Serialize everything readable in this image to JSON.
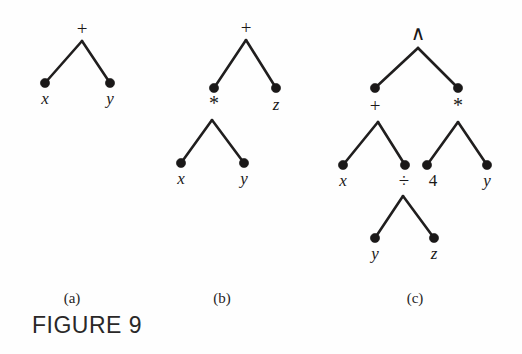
{
  "figure": {
    "caption": "FIGURE 9",
    "background_color": "#fefefe",
    "ink_color": "#1a1818"
  },
  "panels": [
    {
      "id": "a",
      "caption": "(a)",
      "expression": "x + y",
      "nodes": [
        {
          "name": "root",
          "label": "+",
          "kind": "operator",
          "x": 82,
          "y": 41,
          "has_dot": false,
          "label_dx": 0,
          "label_dy": -6
        },
        {
          "name": "leaf-left",
          "label": "x",
          "kind": "variable",
          "x": 45,
          "y": 83,
          "has_dot": true,
          "label_dx": 0,
          "label_dy": 21
        },
        {
          "name": "leaf-right",
          "label": "y",
          "kind": "variable",
          "x": 110,
          "y": 83,
          "has_dot": true,
          "label_dx": 0,
          "label_dy": 21
        }
      ],
      "edges": [
        {
          "from": "root",
          "to": "leaf-left"
        },
        {
          "from": "root",
          "to": "leaf-right"
        }
      ]
    },
    {
      "id": "b",
      "caption": "(b)",
      "expression": "(x * y) + z",
      "nodes": [
        {
          "name": "root",
          "label": "+",
          "kind": "operator",
          "x": 246,
          "y": 40,
          "has_dot": false,
          "label_dx": 0,
          "label_dy": -6
        },
        {
          "name": "mul-node",
          "label": "*",
          "kind": "operator",
          "x": 214,
          "y": 88,
          "has_dot": true,
          "label_dx": 0,
          "label_dy": 22
        },
        {
          "name": "leaf-z",
          "label": "z",
          "kind": "variable",
          "x": 276,
          "y": 88,
          "has_dot": true,
          "label_dx": 0,
          "label_dy": 22
        },
        {
          "name": "mul-apex",
          "label": "",
          "kind": "junction",
          "x": 212,
          "y": 120,
          "has_dot": false,
          "label_dx": 0,
          "label_dy": 0
        },
        {
          "name": "leaf-x",
          "label": "x",
          "kind": "variable",
          "x": 181,
          "y": 163,
          "has_dot": true,
          "label_dx": 0,
          "label_dy": 21
        },
        {
          "name": "leaf-y",
          "label": "y",
          "kind": "variable",
          "x": 244,
          "y": 163,
          "has_dot": true,
          "label_dx": 0,
          "label_dy": 21
        }
      ],
      "edges": [
        {
          "from": "root",
          "to": "mul-node"
        },
        {
          "from": "root",
          "to": "leaf-z"
        },
        {
          "from": "mul-apex",
          "to": "leaf-x"
        },
        {
          "from": "mul-apex",
          "to": "leaf-y"
        }
      ]
    },
    {
      "id": "c",
      "caption": "(c)",
      "expression": "(x + (y / z)) ^ (4 * y)",
      "nodes": [
        {
          "name": "root",
          "label": "∧",
          "kind": "operator",
          "x": 418,
          "y": 48,
          "has_dot": false,
          "label_dx": 0,
          "label_dy": -8
        },
        {
          "name": "plus-node",
          "label": "+",
          "kind": "operator",
          "x": 375,
          "y": 88,
          "has_dot": true,
          "label_dx": 0,
          "label_dy": 24
        },
        {
          "name": "mul-node",
          "label": "*",
          "kind": "operator",
          "x": 458,
          "y": 88,
          "has_dot": true,
          "label_dx": 0,
          "label_dy": 24
        },
        {
          "name": "plus-apex",
          "label": "",
          "kind": "junction",
          "x": 378,
          "y": 122,
          "has_dot": false,
          "label_dx": 0,
          "label_dy": 0
        },
        {
          "name": "leaf-x",
          "label": "x",
          "kind": "variable",
          "x": 343,
          "y": 165,
          "has_dot": true,
          "label_dx": 0,
          "label_dy": 21
        },
        {
          "name": "div-node",
          "label": "÷",
          "kind": "operator",
          "x": 405,
          "y": 165,
          "has_dot": true,
          "label_dx": -1,
          "label_dy": 22
        },
        {
          "name": "mul-apex",
          "label": "",
          "kind": "junction",
          "x": 458,
          "y": 122,
          "has_dot": false,
          "label_dx": 0,
          "label_dy": 0
        },
        {
          "name": "leaf-four",
          "label": "4",
          "kind": "number",
          "x": 427,
          "y": 165,
          "has_dot": true,
          "label_dx": 6,
          "label_dy": 21
        },
        {
          "name": "leaf-y-right",
          "label": "y",
          "kind": "variable",
          "x": 487,
          "y": 165,
          "has_dot": true,
          "label_dx": 0,
          "label_dy": 21
        },
        {
          "name": "div-apex",
          "label": "",
          "kind": "junction",
          "x": 403,
          "y": 196,
          "has_dot": false,
          "label_dx": 0,
          "label_dy": 0
        },
        {
          "name": "leaf-y-bottom",
          "label": "y",
          "kind": "variable",
          "x": 375,
          "y": 238,
          "has_dot": true,
          "label_dx": 0,
          "label_dy": 21
        },
        {
          "name": "leaf-z-bottom",
          "label": "z",
          "kind": "variable",
          "x": 434,
          "y": 238,
          "has_dot": true,
          "label_dx": 0,
          "label_dy": 21
        }
      ],
      "edges": [
        {
          "from": "root",
          "to": "plus-node"
        },
        {
          "from": "root",
          "to": "mul-node"
        },
        {
          "from": "plus-apex",
          "to": "leaf-x"
        },
        {
          "from": "plus-apex",
          "to": "div-node"
        },
        {
          "from": "mul-apex",
          "to": "leaf-four"
        },
        {
          "from": "mul-apex",
          "to": "leaf-y-right"
        },
        {
          "from": "div-apex",
          "to": "leaf-y-bottom"
        },
        {
          "from": "div-apex",
          "to": "leaf-z-bottom"
        }
      ]
    }
  ],
  "captions": [
    {
      "text": "(a)",
      "x": 72,
      "y": 303
    },
    {
      "text": "(b)",
      "x": 222,
      "y": 303
    },
    {
      "text": "(c)",
      "x": 415,
      "y": 303
    }
  ]
}
